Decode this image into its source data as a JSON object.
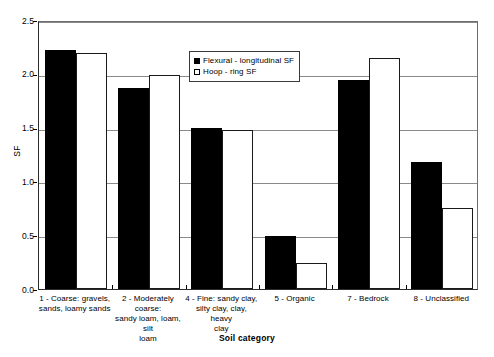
{
  "chart_data": {
    "type": "bar",
    "title": "",
    "xlabel": "Soil category",
    "ylabel": "SF",
    "ylim": [
      0.0,
      2.5
    ],
    "ytick_values": [
      0.0,
      0.5,
      1.0,
      1.5,
      2.0,
      2.5
    ],
    "ytick_labels": [
      "0.0",
      "0.5",
      "1.0",
      "1.5",
      "2.0",
      "2.5"
    ],
    "grid": "horizontal",
    "legend_position": "inside top-center",
    "categories": [
      "1 - Coarse: gravels, sands, loamy sands",
      "2 - Moderately coarse: sandy loam, loam, silt loam",
      "4 - Fine: sandy clay, silty clay, clay, heavy clay",
      "5 - Organic",
      "7 - Bedrock",
      "8 - Unclassified"
    ],
    "category_label_lines": [
      [
        "1 - Coarse: gravels,",
        "sands, loamy sands"
      ],
      [
        "2 - Moderately coarse:",
        "sandy loam, loam, silt",
        "loam"
      ],
      [
        "4 - Fine: sandy clay,",
        "silty clay, clay, heavy",
        "clay"
      ],
      [
        "5 - Organic"
      ],
      [
        "7 - Bedrock"
      ],
      [
        "8 - Unclassified"
      ]
    ],
    "series": [
      {
        "name": "Flexural - longitudinal SF",
        "color": "#000000",
        "fill": "solid",
        "values": [
          2.22,
          1.87,
          1.5,
          0.49,
          1.94,
          1.18
        ]
      },
      {
        "name": "Hoop - ring SF",
        "color": "#ffffff",
        "fill": "hollow",
        "values": [
          2.19,
          1.99,
          1.48,
          0.24,
          2.15,
          0.75
        ]
      }
    ]
  },
  "legend": {
    "entries": [
      {
        "label": "Flexural - longitudinal SF",
        "swatch": "filled-square-icon"
      },
      {
        "label": "Hoop - ring SF",
        "swatch": "hollow-square-icon"
      }
    ]
  },
  "axes": {
    "y_title": "SF",
    "x_title": "Soil category"
  }
}
